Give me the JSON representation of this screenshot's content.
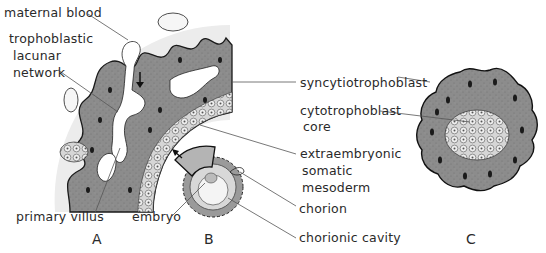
{
  "figure": {
    "panels": [
      {
        "id": "A",
        "label": "A"
      },
      {
        "id": "B",
        "label": "B"
      },
      {
        "id": "C",
        "label": "C"
      }
    ],
    "labels": {
      "maternal_blood": "maternal blood",
      "trophoblastic_1": "trophoblastic",
      "trophoblastic_2": "lacunar",
      "trophoblastic_3": "network",
      "primary_villus": "primary villus",
      "embryo": "embryo",
      "syncytiotrophoblast": "syncytiotrophoblast",
      "cytotrophoblast_1": "cytotrophoblast",
      "cytotrophoblast_2": "core",
      "extraembryonic_1": "extraembryonic",
      "extraembryonic_2": "somatic",
      "extraembryonic_3": "mesoderm",
      "chorion": "chorion",
      "chorionic_cavity": "chorionic cavity"
    },
    "colors": {
      "syncytio_fill": "#8a8a8a",
      "outline": "#1a1a1a",
      "mesoderm_band": "#e6e6e6",
      "cyto_cells": "#d8d8d8",
      "lacunae": "#ffffff",
      "leader_line": "#555555"
    }
  }
}
